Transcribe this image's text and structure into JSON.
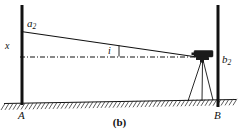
{
  "figure": {
    "caption": "(b)",
    "kind": "surveying-level-collimation-error-diagram",
    "background_color": "#ffffff",
    "ink_color": "#111111"
  },
  "labels": {
    "staff_left_reading": "a",
    "staff_left_reading_sub": "2",
    "staff_right_reading": "b",
    "staff_right_reading_sub": "2",
    "offset": "x",
    "angle": "i",
    "point_left": "A",
    "point_right": "B"
  },
  "geometry": {
    "left_staff": {
      "x": 22,
      "y_top": 5,
      "y_bottom": 105,
      "width": 3
    },
    "right_staff": {
      "x": 218,
      "y_top": 5,
      "y_bottom": 107,
      "width": 3
    },
    "sight_line": {
      "x1": 22,
      "y1": 32,
      "x2": 196,
      "y2": 57
    },
    "horizontal_line": {
      "x1": 22,
      "y1": 57,
      "x2": 196,
      "y2": 57,
      "style": "dash-dot"
    },
    "ground_line": {
      "x1": 4,
      "y1": 103,
      "x2": 236,
      "y2": 99
    },
    "instrument": {
      "x": 195,
      "y": 50,
      "body_width": 20,
      "body_height": 7
    },
    "angle_marker_x": 118
  },
  "colors": {
    "line": "#111111",
    "instrument_body": "#1a1a1a",
    "hatch": "#333333"
  }
}
